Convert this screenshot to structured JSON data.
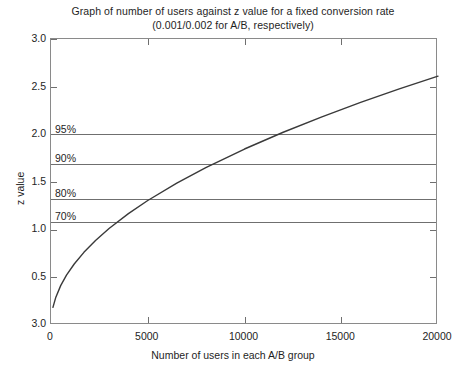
{
  "chart_data": {
    "type": "line",
    "title": "Graph of number of users against z value for a fixed conversion rate",
    "subtitle": "(0.001/0.002 for A/B, respectively)",
    "xlabel": "Number of users in each A/B group",
    "ylabel": "z value",
    "xlim": [
      0,
      20000
    ],
    "ylim": [
      0.0,
      3.0
    ],
    "grid": false,
    "legend": "none",
    "xticks": [
      "0",
      "5000",
      "10000",
      "15000",
      "20000"
    ],
    "xtick_values": [
      0,
      5000,
      10000,
      15000,
      20000
    ],
    "yticks": [
      "3.0",
      "2.5",
      "2.0",
      "1.5",
      "1.0",
      "0.5",
      "3.0"
    ],
    "ytick_values": [
      3.0,
      2.5,
      2.0,
      1.5,
      1.0,
      0.5,
      0.0
    ],
    "series": [
      {
        "name": "z value",
        "x": [
          100,
          250,
          500,
          800,
          1200,
          1700,
          2300,
          3000,
          4000,
          5000,
          6500,
          8000,
          10000,
          12000,
          14000,
          16000,
          18000,
          20000
        ],
        "values": [
          0.185,
          0.292,
          0.413,
          0.523,
          0.64,
          0.762,
          0.886,
          1.012,
          1.168,
          1.306,
          1.489,
          1.651,
          1.846,
          2.022,
          2.184,
          2.335,
          2.476,
          2.61
        ]
      }
    ],
    "threshold_lines": [
      {
        "label": "95%",
        "value": 1.96
      },
      {
        "label": "90%",
        "value": 1.645
      },
      {
        "label": "80%",
        "value": 1.28
      },
      {
        "label": "70%",
        "value": 1.04
      }
    ]
  }
}
